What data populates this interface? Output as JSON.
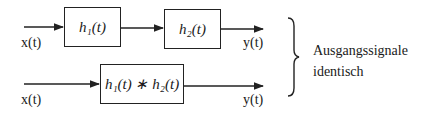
{
  "diagram": {
    "top_chain": {
      "input_label": "x(t)",
      "blocks": [
        {
          "id": "h1",
          "label": "h₁(t)"
        },
        {
          "id": "h2",
          "label": "h₂(t)"
        }
      ],
      "output_label": "y(t)"
    },
    "bottom_chain": {
      "input_label": "x(t)",
      "blocks": [
        {
          "id": "h1_conv_h2",
          "label": "h₁(t) ∗ h₂(t)"
        }
      ],
      "output_label": "y(t)"
    },
    "annotation": {
      "line1": "Ausgangssignale",
      "line2": "identisch"
    },
    "colors": {
      "line": "#222222",
      "background": "#ffffff"
    }
  }
}
